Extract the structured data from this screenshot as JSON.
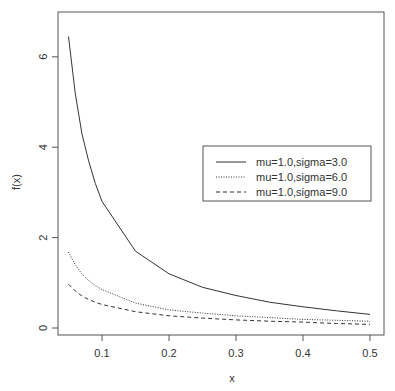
{
  "chart_data": {
    "type": "line",
    "title": "",
    "xlabel": "x",
    "ylabel": "f(x)",
    "xlim": [
      0.05,
      0.5
    ],
    "ylim": [
      0,
      6.5
    ],
    "xticks": [
      "0.1",
      "0.2",
      "0.3",
      "0.4",
      "0.5"
    ],
    "yticks": [
      "0",
      "2",
      "4",
      "6"
    ],
    "grid": false,
    "legend_position": "right-center",
    "x": [
      0.05,
      0.06,
      0.07,
      0.08,
      0.09,
      0.1,
      0.15,
      0.2,
      0.25,
      0.3,
      0.35,
      0.4,
      0.45,
      0.5
    ],
    "series": [
      {
        "name": "mu=1.0,sigma=3.0",
        "style": "solid",
        "values": [
          6.45,
          5.2,
          4.3,
          3.7,
          3.2,
          2.8,
          1.7,
          1.2,
          0.9,
          0.72,
          0.57,
          0.47,
          0.38,
          0.3
        ]
      },
      {
        "name": "mu=1.0,sigma=6.0",
        "style": "dotted",
        "values": [
          1.68,
          1.4,
          1.2,
          1.05,
          0.94,
          0.85,
          0.55,
          0.4,
          0.33,
          0.27,
          0.23,
          0.19,
          0.17,
          0.15
        ]
      },
      {
        "name": "mu=1.0,sigma=9.0",
        "style": "dashed",
        "values": [
          0.97,
          0.82,
          0.71,
          0.63,
          0.57,
          0.52,
          0.36,
          0.27,
          0.22,
          0.18,
          0.15,
          0.13,
          0.1,
          0.08
        ]
      }
    ]
  }
}
